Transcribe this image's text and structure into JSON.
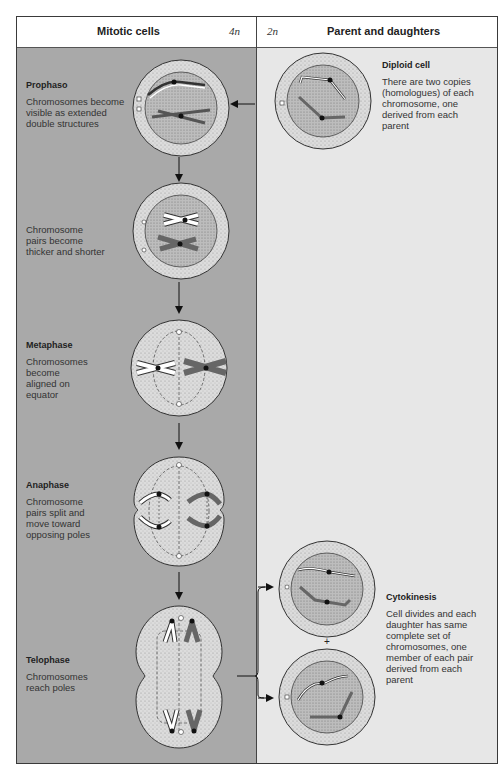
{
  "header": {
    "left_title": "Mitotic cells",
    "left_ploidy": "4n",
    "right_ploidy": "2n",
    "right_title": "Parent and daughters"
  },
  "stages": [
    {
      "id": "prophase",
      "title": "Prophaso",
      "description": "Chromosomes become visible as extended double structures"
    },
    {
      "id": "late-prophase",
      "title": "",
      "description": "Chromosome pairs become thicker and shorter"
    },
    {
      "id": "metaphase",
      "title": "Metaphase",
      "description": "Chromosomes become aligned on equator"
    },
    {
      "id": "anaphase",
      "title": "Anaphase",
      "description": "Chromosome pairs split and move toward opposing poles"
    },
    {
      "id": "telophase",
      "title": "Telophase",
      "description": "Chromosomes reach poles"
    }
  ],
  "parent": {
    "title": "Diploid cell",
    "description": "There are two copies (homologues) of each chromosome, one derived from each parent"
  },
  "daughters": {
    "title": "Cytokinesis",
    "description": "Cell divides and each daughter has same complete set of chromosomes, one member of each pair derived from each parent",
    "plus": "+"
  },
  "colors": {
    "left_bg": "#a9a9a9",
    "right_bg": "#e7e7e7",
    "cell_fill": "#d9d9d9",
    "nucleus_fill": "#b8b8b8",
    "chromosome_dark": "#6e6e6e"
  }
}
